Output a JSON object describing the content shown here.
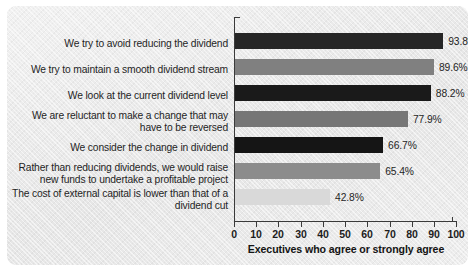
{
  "chart_data": {
    "type": "bar",
    "orientation": "horizontal",
    "title": "",
    "xlabel": "Executives who agree or strongly agree",
    "ylabel": "",
    "xlim": [
      0,
      100
    ],
    "xticks": [
      "0",
      "10",
      "20",
      "30",
      "40",
      "50",
      "60",
      "70",
      "80",
      "90",
      "100"
    ],
    "grid": false,
    "legend": false,
    "categories": [
      "We try to avoid reducing the dividend",
      "We try to maintain a smooth dividend stream",
      "We look at the current dividend level",
      "We are reluctant to make a change that may have to be reversed",
      "We consider the change in dividend",
      "Rather than reducing dividends, we would raise new funds to undertake a profitable project",
      "The cost of external capital is lower than that of a dividend cut"
    ],
    "values": [
      93.8,
      89.6,
      88.2,
      77.9,
      66.7,
      65.4,
      42.8
    ],
    "value_labels": [
      "93.8%",
      "89.6%",
      "88.2%",
      "77.9%",
      "66.7%",
      "65.4%",
      "42.8%"
    ],
    "bar_colors": [
      "#262626",
      "#808080",
      "#1a1a1a",
      "#767676",
      "#151515",
      "#8c8c8c",
      "#d9d9d9"
    ]
  },
  "figure": {
    "background_color": "#ececec",
    "axis_color": "#3a3a3a",
    "text_color": "#1f1f1f"
  }
}
